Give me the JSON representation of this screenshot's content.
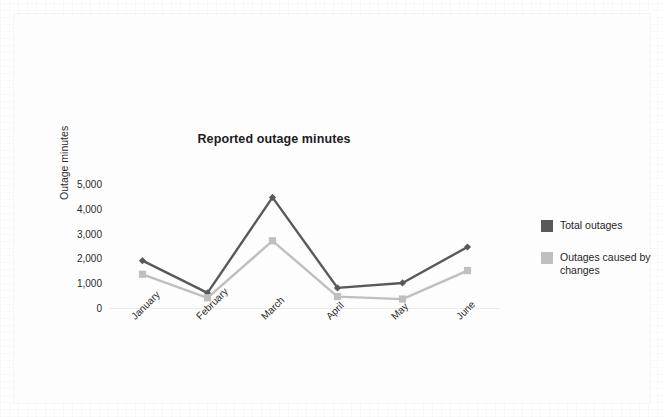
{
  "chart_data": {
    "type": "line",
    "title": "Reported outage minutes",
    "xlabel": "",
    "ylabel": "Outage minutes",
    "categories": [
      "January",
      "February",
      "March",
      "April",
      "May",
      "June"
    ],
    "series": [
      {
        "name": "Total outages",
        "color": "#595959",
        "marker": "diamond",
        "values": [
          1950,
          650,
          4500,
          850,
          1050,
          2500
        ]
      },
      {
        "name": "Outages caused by changes",
        "color": "#bfbfbf",
        "marker": "square",
        "values": [
          1400,
          450,
          2750,
          500,
          400,
          1550
        ]
      }
    ],
    "ylim": [
      0,
      5000
    ],
    "y_ticks": [
      0,
      1000,
      2000,
      3000,
      4000,
      5000
    ],
    "y_tick_labels": [
      "0",
      "1,000",
      "2,000",
      "3,000",
      "4,000",
      "5,000"
    ],
    "grid": false,
    "legend_position": "right"
  },
  "legend": {
    "items": [
      {
        "label": "Total outages",
        "color": "#595959"
      },
      {
        "label": "Outages caused by changes",
        "color": "#bfbfbf"
      }
    ]
  }
}
